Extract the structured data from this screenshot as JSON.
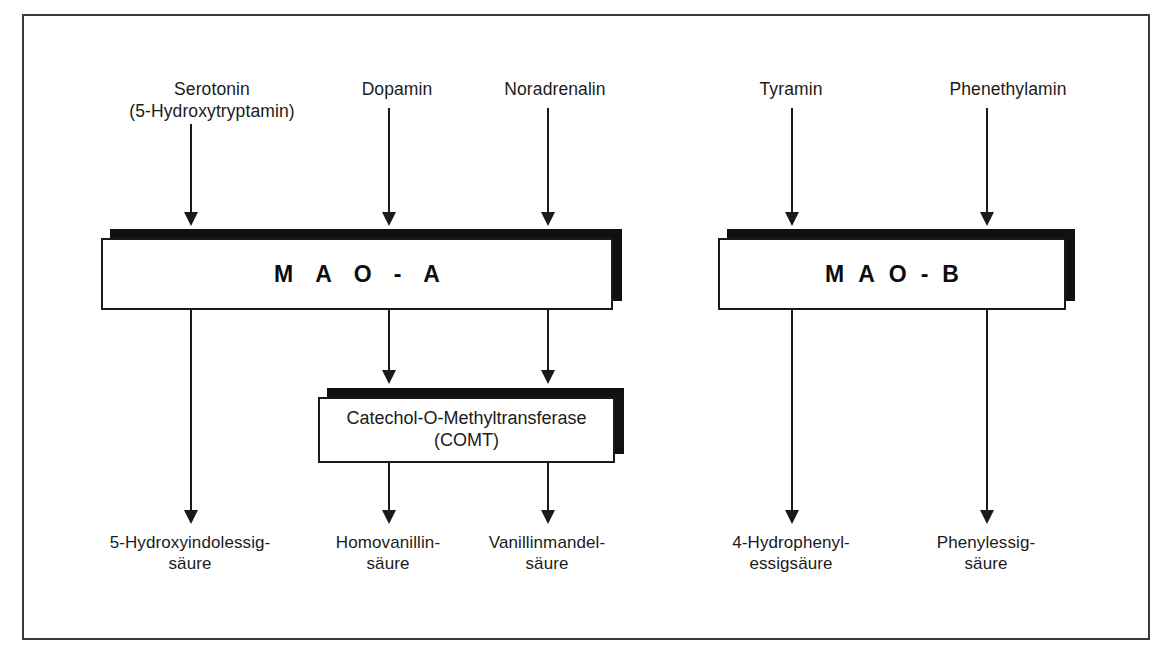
{
  "figure": {
    "frame_color": "#3a3a3a",
    "ink_color": "#1a1a1a",
    "background": "#ffffff"
  },
  "substrates": [
    {
      "id": "serotonin",
      "label": "Serotonin\n(5-Hydroxytryptamin)"
    },
    {
      "id": "dopamin",
      "label": "Dopamin"
    },
    {
      "id": "noradrenalin",
      "label": "Noradrenalin"
    },
    {
      "id": "tyramin",
      "label": "Tyramin"
    },
    {
      "id": "phenethylamin",
      "label": "Phenethylamin"
    }
  ],
  "enzymes": [
    {
      "id": "mao-a",
      "label": "MAO-A"
    },
    {
      "id": "mao-b",
      "label": "MAO-B"
    },
    {
      "id": "comt",
      "label": "Catechol-O-Methyltransferase\n(COMT)"
    }
  ],
  "products": [
    {
      "id": "hydroxyindolessigsaeure",
      "label": "5-Hydroxyindolessig-\nsäure"
    },
    {
      "id": "homovanillinsaeure",
      "label": "Homovanillin-\nsäure"
    },
    {
      "id": "vanillinmandelsaeure",
      "label": "Vanillinmandel-\nsäure"
    },
    {
      "id": "hydrophenylessigsaeure",
      "label": "4-Hydrophenyl-\nessigsäure"
    },
    {
      "id": "phenylessigsaeure",
      "label": "Phenylessig-\nsäure"
    }
  ]
}
